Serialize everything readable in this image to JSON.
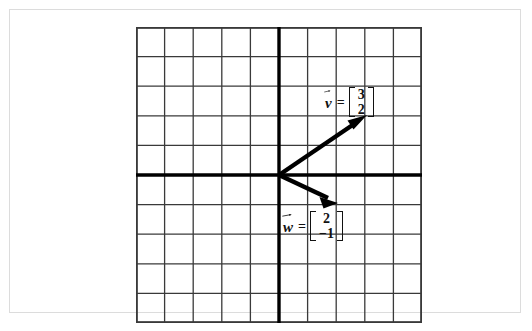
{
  "figure": {
    "grid": {
      "cols": 10,
      "rows": 10,
      "cell_width": 28.6,
      "cell_height": 29.6,
      "origin_col": 5,
      "origin_row": 5,
      "grid_color": "#3a3a3a",
      "axis_color": "#000000",
      "grid_line_width": 1.3,
      "axis_line_width": 3.2,
      "border_color": "#3a3a3a"
    },
    "vectors": [
      {
        "id": "v",
        "name": "v",
        "equals": "=",
        "components": [
          "3",
          "2"
        ],
        "x": 3,
        "y": 2,
        "color": "#000000",
        "stroke_width": 4.2
      },
      {
        "id": "w",
        "name": "w",
        "equals": "=",
        "components": [
          "2",
          "−1"
        ],
        "x": 2,
        "y": -1,
        "color": "#000000",
        "stroke_width": 4.2
      }
    ]
  },
  "card": {
    "background": "#ffffff",
    "border_color": "#dcdcdc"
  },
  "caption": {
    "text": ""
  }
}
